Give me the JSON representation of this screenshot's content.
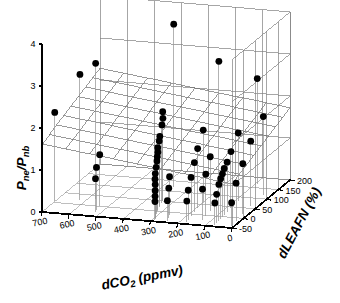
{
  "figure": {
    "background_color": "#ffffff",
    "marker_color": "#000000",
    "grid_color": "#808080",
    "axis_color": "#000000",
    "surface_color": "#6e6e6e",
    "dropline_color": "#9a9a9a"
  },
  "chart_data": {
    "type": "scatter",
    "projection": "3d",
    "title": "",
    "subtitle": "",
    "xlabel": "dCO2 (ppmv)",
    "xlabel_main": "dCO",
    "xlabel_sub": "2",
    "xlabel_unit": " (ppmv)",
    "ylabel": "dLEAFN (%)",
    "zlabel": "Pne/Pnb",
    "zlabel_num": "P",
    "zlabel_num_sub": "ne",
    "zlabel_den": "P",
    "zlabel_den_sub": "nb",
    "xlim": [
      700,
      0
    ],
    "ylim": [
      -50,
      200
    ],
    "zlim": [
      0,
      4
    ],
    "xticks": [
      700,
      600,
      500,
      400,
      300,
      200,
      100,
      0
    ],
    "xtick_labels": [
      "700",
      "600",
      "500",
      "400",
      "300",
      "200",
      "100",
      "0"
    ],
    "yticks": [
      -50,
      0,
      50,
      100,
      150,
      200
    ],
    "ytick_labels": [
      "-50",
      "0",
      "50",
      "100",
      "150",
      "200"
    ],
    "zticks": [
      0,
      1,
      2,
      3,
      4
    ],
    "ztick_labels": [
      "0",
      "1",
      "2",
      "3",
      "4"
    ],
    "grid": true,
    "grid_walls": [
      "back",
      "right",
      "floor"
    ],
    "legend": false,
    "legend_position": "none",
    "droplines": true,
    "surface": {
      "type": "fitted_plane",
      "label": "fitted response surface",
      "nx": 8,
      "ny": 8,
      "z_corners": {
        "x700_yneg50": 1.62,
        "x0_yneg50": 1.05,
        "x700_y200": 2.28,
        "x0_y200": 1.72
      }
    },
    "xlabel_axis": "dCO2 (ppmv)",
    "ylabel_axis": "dLEAFN (%)",
    "zlabel_axis": "Pne/Pnb",
    "points": [
      {
        "x": 700,
        "y": 5,
        "z": 2.12
      },
      {
        "x": 620,
        "y": 20,
        "z": 3.0
      },
      {
        "x": 575,
        "y": 35,
        "z": 3.22
      },
      {
        "x": 530,
        "y": 0,
        "z": 1.23
      },
      {
        "x": 525,
        "y": -20,
        "z": 1.02
      },
      {
        "x": 520,
        "y": -30,
        "z": 0.8
      },
      {
        "x": 360,
        "y": 120,
        "z": 3.88
      },
      {
        "x": 345,
        "y": 55,
        "z": 2.1
      },
      {
        "x": 340,
        "y": 50,
        "z": 1.97
      },
      {
        "x": 335,
        "y": 40,
        "z": 1.86
      },
      {
        "x": 330,
        "y": 25,
        "z": 1.66
      },
      {
        "x": 328,
        "y": 20,
        "z": 1.57
      },
      {
        "x": 325,
        "y": 10,
        "z": 1.46
      },
      {
        "x": 320,
        "y": 5,
        "z": 1.38
      },
      {
        "x": 318,
        "y": 0,
        "z": 1.3
      },
      {
        "x": 315,
        "y": -5,
        "z": 1.22
      },
      {
        "x": 312,
        "y": -12,
        "z": 1.1
      },
      {
        "x": 310,
        "y": -18,
        "z": 0.98
      },
      {
        "x": 305,
        "y": -25,
        "z": 0.88
      },
      {
        "x": 300,
        "y": -30,
        "z": 0.78
      },
      {
        "x": 296,
        "y": -35,
        "z": 0.66
      },
      {
        "x": 292,
        "y": -40,
        "z": 0.55
      },
      {
        "x": 288,
        "y": -45,
        "z": 0.45
      },
      {
        "x": 260,
        "y": -15,
        "z": 0.92
      },
      {
        "x": 250,
        "y": -30,
        "z": 0.72
      },
      {
        "x": 245,
        "y": -42,
        "z": 0.48
      },
      {
        "x": 215,
        "y": 145,
        "z": 2.96
      },
      {
        "x": 200,
        "y": 60,
        "z": 1.72
      },
      {
        "x": 195,
        "y": 30,
        "z": 1.42
      },
      {
        "x": 190,
        "y": 10,
        "z": 1.18
      },
      {
        "x": 185,
        "y": -10,
        "z": 0.92
      },
      {
        "x": 180,
        "y": -28,
        "z": 0.7
      },
      {
        "x": 175,
        "y": -40,
        "z": 0.5
      },
      {
        "x": 140,
        "y": 20,
        "z": 1.3
      },
      {
        "x": 135,
        "y": -5,
        "z": 1.0
      },
      {
        "x": 130,
        "y": -25,
        "z": 0.74
      },
      {
        "x": 95,
        "y": 170,
        "z": 2.5
      },
      {
        "x": 88,
        "y": 80,
        "z": 1.62
      },
      {
        "x": 85,
        "y": 45,
        "z": 1.34
      },
      {
        "x": 82,
        "y": 25,
        "z": 1.18
      },
      {
        "x": 80,
        "y": 10,
        "z": 1.1
      },
      {
        "x": 78,
        "y": 0,
        "z": 1.02
      },
      {
        "x": 76,
        "y": -10,
        "z": 0.95
      },
      {
        "x": 74,
        "y": -20,
        "z": 0.86
      },
      {
        "x": 72,
        "y": -32,
        "z": 0.68
      },
      {
        "x": 70,
        "y": -42,
        "z": 0.52
      },
      {
        "x": 30,
        "y": 120,
        "z": 1.86
      },
      {
        "x": 25,
        "y": 60,
        "z": 1.55
      },
      {
        "x": 20,
        "y": 20,
        "z": 1.2
      },
      {
        "x": 15,
        "y": -15,
        "z": 0.9
      },
      {
        "x": 10,
        "y": -40,
        "z": 0.55
      }
    ]
  }
}
